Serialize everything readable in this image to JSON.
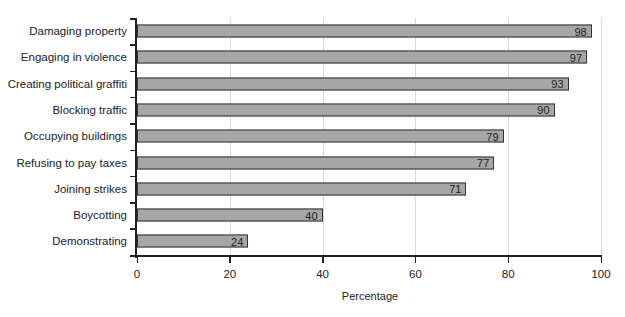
{
  "chart_data": {
    "type": "bar",
    "orientation": "horizontal",
    "title": "",
    "xlabel": "Percentage",
    "ylabel": "",
    "xlim": [
      0,
      100
    ],
    "xticks": [
      0,
      20,
      40,
      60,
      80,
      100
    ],
    "grid": "vertical",
    "legend": "none",
    "categories": [
      "Damaging property",
      "Engaging in violence",
      "Creating political graffiti",
      "Blocking traffic",
      "Occupying buildings",
      "Refusing to pay taxes",
      "Joining strikes",
      "Boycotting",
      "Demonstrating"
    ],
    "values": [
      98,
      97,
      93,
      90,
      79,
      77,
      71,
      40,
      24
    ],
    "bar_color": "#a6a6a6"
  }
}
